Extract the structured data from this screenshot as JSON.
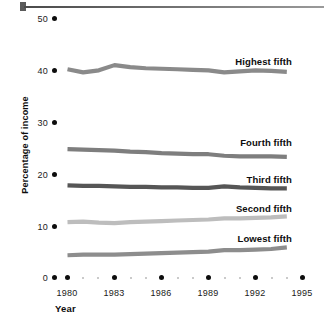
{
  "chart_data": {
    "type": "line",
    "title": "",
    "xlabel": "Year",
    "ylabel": "Percentage of income",
    "xlim": [
      1979,
      1995
    ],
    "ylim": [
      0,
      50
    ],
    "ytick_labels": [
      "0",
      "10",
      "20",
      "30",
      "40",
      "50"
    ],
    "ytick_values": [
      0,
      10,
      20,
      30,
      40,
      50
    ],
    "xtick_labels": [
      "1980",
      "1983",
      "1986",
      "1989",
      "1992",
      "1995"
    ],
    "xtick_values": [
      1980,
      1983,
      1986,
      1989,
      1992,
      1995
    ],
    "x": [
      1980,
      1981,
      1982,
      1983,
      1984,
      1985,
      1986,
      1987,
      1988,
      1989,
      1990,
      1991,
      1992,
      1993,
      1994
    ],
    "grid": false,
    "legend_position": "inline-right",
    "series": [
      {
        "name": "Highest fifth",
        "color": "#8a8a8a",
        "values": [
          40.2,
          39.6,
          40.0,
          41.0,
          40.6,
          40.4,
          40.3,
          40.2,
          40.1,
          40.0,
          39.6,
          39.8,
          40.0,
          39.9,
          39.7
        ]
      },
      {
        "name": "Fourth fifth",
        "color": "#7e7e7e",
        "values": [
          24.8,
          24.7,
          24.6,
          24.5,
          24.3,
          24.2,
          24.0,
          23.9,
          23.8,
          23.8,
          23.5,
          23.4,
          23.4,
          23.4,
          23.3
        ]
      },
      {
        "name": "Third fifth",
        "color": "#565656",
        "values": [
          17.8,
          17.7,
          17.7,
          17.6,
          17.5,
          17.5,
          17.4,
          17.4,
          17.3,
          17.3,
          17.6,
          17.4,
          17.3,
          17.2,
          17.2
        ]
      },
      {
        "name": "Second fifth",
        "color": "#bdbdbd",
        "values": [
          10.7,
          10.8,
          10.6,
          10.5,
          10.7,
          10.8,
          10.9,
          11.0,
          11.1,
          11.2,
          11.4,
          11.4,
          11.5,
          11.6,
          11.8
        ]
      },
      {
        "name": "Lowest fifth",
        "color": "#8d8d8d",
        "values": [
          4.3,
          4.4,
          4.4,
          4.4,
          4.5,
          4.6,
          4.7,
          4.8,
          4.9,
          5.0,
          5.3,
          5.3,
          5.4,
          5.5,
          5.8
        ]
      }
    ],
    "series_label_text": {
      "highest": "Highest fifth",
      "fourth": "Fourth fifth",
      "third": "Third fifth",
      "second": "Second fifth",
      "lowest": "Lowest fifth"
    }
  },
  "axis": {
    "ylabel": "Percentage of income",
    "xlabel": "Year"
  }
}
